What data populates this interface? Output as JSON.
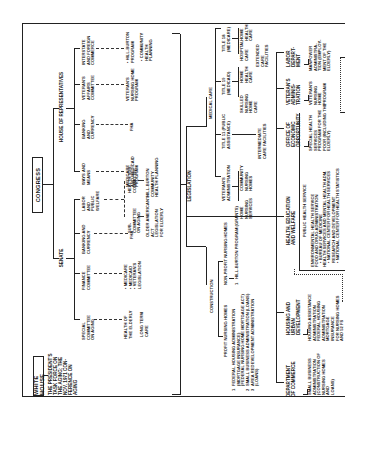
{
  "top_level": {
    "white_house": "White House",
    "congress": "Congress"
  },
  "white_house": {
    "task_force": "The President's\nTask Force on\nthe Aging; the\nNov. 1971 Con-\nference on\nAging"
  },
  "congress": {
    "senate": "Senate",
    "house": "House of Representatives",
    "senate_committees": [
      {
        "label": "Special Committee\non Aging",
        "outputs": [
          "Health of\nthe Elderly",
          "Long Term\nCare"
        ]
      },
      {
        "label": "Finance\nCommittee",
        "outputs": [
          "• Medicare\n• Medicaid\n• Veteran's\nLegislation"
        ]
      },
      {
        "label": "Banking and\nCurrency",
        "outputs": [
          "FHA"
        ]
      },
      {
        "label": "Labor\nand\nPublic\nWelfare",
        "outputs": [
          "Sub-\nCommittee\non Aging",
          "Health Sub-\nCommittee"
        ]
      }
    ],
    "labor_subs": {
      "aging_out": "Older American's\nAct\nLegislation\nfor Elderly",
      "health_out": "Hill-Burton\nCommunity\nHealth Planning"
    },
    "house_committees": [
      {
        "label": "Ways and\nMeans",
        "outputs": [
          "Medicare\nand Medicaid\nProgram"
        ]
      },
      {
        "label": "Banking\nand\nCurrency",
        "outputs": [
          "FHA"
        ]
      },
      {
        "label": "Veteran's\nAffairs\nCommittee",
        "outputs": [
          "Veteran's\nNursing Home\nProgram"
        ]
      },
      {
        "label": "Interstate\nand Foreign\nCommerce",
        "outputs": [
          "• Hill-Burton\nProgram",
          "• Community\nHealth\nPlanning"
        ]
      }
    ]
  },
  "legislation": {
    "label": "Legislation",
    "construction": {
      "label": "Construction",
      "profit": "Profit Nursing Homes",
      "profit_items": [
        {
          "num": "1",
          "text": "Federal Housing Administration\n(Mortgage Insurance)\n(Federal Nursing Home Mortgage Act)"
        },
        {
          "num": "2",
          "text": "Small Business Administration (Loans)"
        },
        {
          "num": "3",
          "text": "Area Redevelopment Administration\n(Loans)"
        }
      ],
      "nonprofit": "Non-Profit Nursing Homes",
      "nonprofit_items": [
        {
          "num": "1",
          "text": "Hill-Burton Program (Grants)"
        }
      ]
    },
    "medical_care": {
      "label": "Medical Care",
      "branches": [
        {
          "label": "Veteran's\nAdministration",
          "children": [
            "Home\nNursing\nServices",
            "Community\nNursing\nHomes"
          ]
        },
        {
          "label": "Title 11 (Public\nAssistance)",
          "children": [
            "Intermediate\nCare Facilities"
          ]
        },
        {
          "label": "Title 19\n(Medicaid)",
          "children": [
            "Skilled\nNursing\nHome\nCare",
            "Home\nHealth\nCare"
          ]
        },
        {
          "label": "Title 18\n(Medicare)",
          "children": [
            "Hospital\nCare",
            "Home\nHealth\nCare",
            "Extended\nCare\nFacilities"
          ]
        }
      ]
    }
  },
  "departments": [
    {
      "label": "Department\nof Commerce",
      "detail": "Small Business\nAdministration\n(Construction of\nNursing Homes and\nLoans)"
    },
    {
      "label": "Housing and\nUrban\nDevelopment",
      "detail": "Housing Assistance\nAdministration\nFederal Housing\nAdministration\nMortgage Insurance\nfor Nursing Homes\nand 52 FS"
    },
    {
      "label": "Health, Education\nand Welfare",
      "detail": "Public Health Service",
      "sub_items": [
        "Environmental Health Service",
        "Food and Drug Administration",
        "• Bureau of Medicine",
        "Health Services and Mental Health Adm.",
        "• National Center for Health Services\nResearch and Development",
        "• National Center for Health Statistics"
      ]
    },
    {
      "label": "Office of\nEconomic\nOpportunity",
      "detail": "Special Health\nServices\nProgram for the\nPoor (Including the\nElderly)"
    },
    {
      "label": "Veteran's\nAdminis-\ntration",
      "detail": "Veteran's\nNursing\nHome\nProgram"
    },
    {
      "label": "Labor\nDepart-\nment",
      "detail": "Manpower\nAdministra-\ntion (Employ-\nment of the\nElderly)"
    }
  ]
}
